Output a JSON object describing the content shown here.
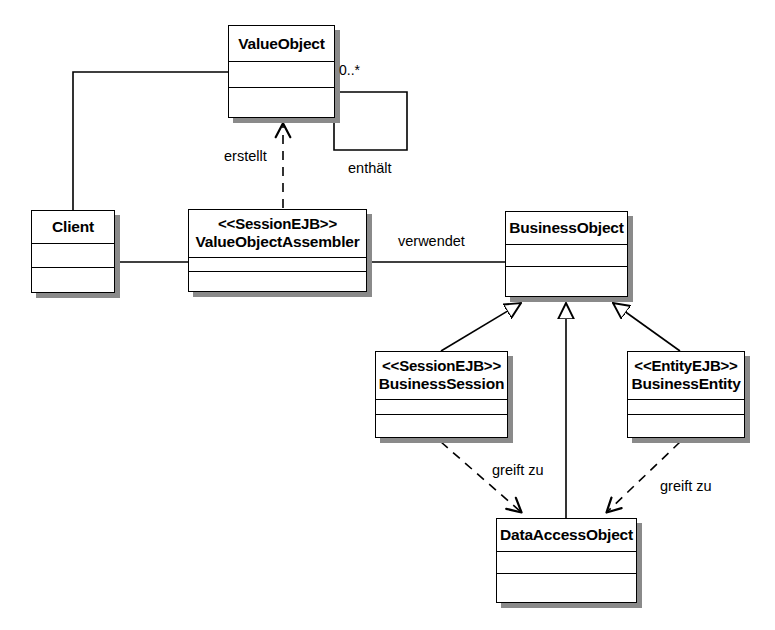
{
  "diagram": {
    "stroke_color": "#000000",
    "shadow_color": "#8a8a8a",
    "background": "#ffffff",
    "classes": [
      {
        "id": "value-object",
        "stereotype": "",
        "name": "ValueObject",
        "x": 228,
        "y": 25,
        "width": 107,
        "height": 93,
        "header_height": 36,
        "mid_height": 26
      },
      {
        "id": "client",
        "stereotype": "",
        "name": "Client",
        "x": 31,
        "y": 210,
        "width": 84,
        "height": 83,
        "header_height": 33,
        "mid_height": 24
      },
      {
        "id": "value-object-assembler",
        "stereotype": "<<SessionEJB>>",
        "name": "ValueObjectAssembler",
        "x": 188,
        "y": 209,
        "width": 179,
        "height": 83,
        "header_height": 48,
        "mid_height": 14
      },
      {
        "id": "business-object",
        "stereotype": "",
        "name": "BusinessObject",
        "x": 505,
        "y": 211,
        "width": 123,
        "height": 86,
        "header_height": 33,
        "mid_height": 22
      },
      {
        "id": "business-session",
        "stereotype": "<<SessionEJB>>",
        "name": "BusinessSession",
        "x": 375,
        "y": 351,
        "width": 133,
        "height": 87,
        "header_height": 48,
        "mid_height": 15
      },
      {
        "id": "business-entity",
        "stereotype": "<<EntityEJB>>",
        "name": "BusinessEntity",
        "x": 627,
        "y": 351,
        "width": 118,
        "height": 87,
        "header_height": 48,
        "mid_height": 15
      },
      {
        "id": "data-access-object",
        "stereotype": "",
        "name": "DataAccessObject",
        "x": 496,
        "y": 518,
        "width": 141,
        "height": 85,
        "header_height": 33,
        "mid_height": 22
      }
    ],
    "edge_labels": [
      {
        "id": "erstellt",
        "text": "erstellt",
        "x": 224,
        "y": 148
      },
      {
        "id": "enthaelt",
        "text": "enthält",
        "x": 348,
        "y": 160
      },
      {
        "id": "verwendet",
        "text": "verwendet",
        "x": 398,
        "y": 233
      },
      {
        "id": "greift-zu-session",
        "text": "greift zu",
        "x": 492,
        "y": 462
      },
      {
        "id": "greift-zu-entity",
        "text": "greift zu",
        "x": 660,
        "y": 478
      }
    ],
    "multiplicities": [
      {
        "id": "value-object-multiplicity",
        "text": "0..*",
        "x": 339,
        "y": 62
      }
    ],
    "relations": [
      {
        "id": "client-to-value-object",
        "type": "association",
        "from": "client",
        "to": "value-object",
        "label": ""
      },
      {
        "id": "client-to-assembler",
        "type": "association",
        "from": "client",
        "to": "value-object-assembler",
        "label": ""
      },
      {
        "id": "assembler-creates-value-object",
        "type": "dependency",
        "from": "value-object-assembler",
        "to": "value-object",
        "label": "erstellt"
      },
      {
        "id": "value-object-contains-value-object",
        "type": "association",
        "from": "value-object",
        "to": "value-object",
        "label": "enthält"
      },
      {
        "id": "assembler-uses-business-object",
        "type": "association",
        "from": "value-object-assembler",
        "to": "business-object",
        "label": "verwendet"
      },
      {
        "id": "business-session-inherits-business-object",
        "type": "generalization",
        "from": "business-session",
        "to": "business-object",
        "label": ""
      },
      {
        "id": "data-access-object-inherits-business-object",
        "type": "generalization",
        "from": "data-access-object",
        "to": "business-object",
        "label": ""
      },
      {
        "id": "business-entity-inherits-business-object",
        "type": "generalization",
        "from": "business-entity",
        "to": "business-object",
        "label": ""
      },
      {
        "id": "business-session-accesses-dao",
        "type": "dependency",
        "from": "business-session",
        "to": "data-access-object",
        "label": "greift zu"
      },
      {
        "id": "business-entity-accesses-dao",
        "type": "dependency",
        "from": "business-entity",
        "to": "data-access-object",
        "label": "greift zu"
      }
    ]
  }
}
